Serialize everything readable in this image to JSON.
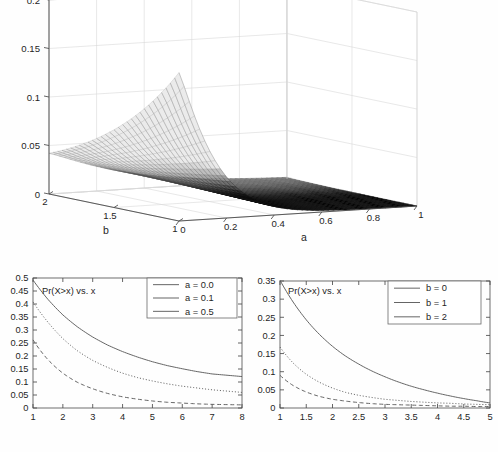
{
  "figure": {
    "background": "#ffffff",
    "line_color": "#5d5d5d",
    "axis_color": "#4a4a4a"
  },
  "chart_data": [
    {
      "id": "surface-3d",
      "type": "surface",
      "title": "",
      "xlabel": "a",
      "ylabel": "b",
      "zlabel": "",
      "xlim": [
        0,
        1
      ],
      "ylim": [
        1,
        2
      ],
      "zlim": [
        0,
        0.2
      ],
      "xticks": [
        "0",
        "0.2",
        "0.4",
        "0.6",
        "0.8",
        "1"
      ],
      "xtick_values": [
        0,
        0.2,
        0.4,
        0.6,
        0.8,
        1
      ],
      "yticks": [
        "2",
        "1.5",
        "1"
      ],
      "ytick_values": [
        2,
        1.5,
        1
      ],
      "zticks": [
        "0",
        "0.05",
        "0.1",
        "0.15",
        "0.2"
      ],
      "ztick_values": [
        0,
        0.05,
        0.1,
        0.15,
        0.2
      ],
      "grid": true,
      "legend": "none",
      "peak_value": 0.153,
      "peak_at": {
        "a": 0.0,
        "b": 1.0
      },
      "edge_value_b2_a0": 0.042,
      "description": "Mesh surface decaying from a peak near a=0,b=1 toward zero as a increases; dark shaded flat region at large a",
      "colormap": "gray"
    },
    {
      "id": "left-curves",
      "type": "line",
      "title": "Pr(X>x) vs. x",
      "xlabel": "",
      "ylabel": "",
      "xlim": [
        1,
        8
      ],
      "ylim": [
        0,
        0.5
      ],
      "xticks": [
        "1",
        "2",
        "3",
        "4",
        "5",
        "6",
        "7",
        "8"
      ],
      "xtick_values": [
        1,
        2,
        3,
        4,
        5,
        6,
        7,
        8
      ],
      "yticks": [
        "0",
        "0.05",
        "0.1",
        "0.15",
        "0.2",
        "0.25",
        "0.3",
        "0.35",
        "0.4",
        "0.45",
        "0.5"
      ],
      "ytick_values": [
        0,
        0.05,
        0.1,
        0.15,
        0.2,
        0.25,
        0.3,
        0.35,
        0.4,
        0.45,
        0.5
      ],
      "grid": false,
      "legend_position": "top-right",
      "x": [
        1,
        1.5,
        2,
        2.5,
        3,
        3.5,
        4,
        4.5,
        5,
        5.5,
        6,
        6.5,
        7,
        7.5,
        8
      ],
      "series": [
        {
          "name": "a = 0.0",
          "style": "solid",
          "values": [
            0.492,
            0.418,
            0.358,
            0.311,
            0.273,
            0.242,
            0.217,
            0.196,
            0.178,
            0.163,
            0.151,
            0.14,
            0.131,
            0.126,
            0.121
          ]
        },
        {
          "name": "a = 0.1",
          "style": "dotted",
          "values": [
            0.408,
            0.33,
            0.267,
            0.219,
            0.183,
            0.156,
            0.134,
            0.117,
            0.104,
            0.093,
            0.084,
            0.077,
            0.07,
            0.065,
            0.06
          ]
        },
        {
          "name": "a = 0.5",
          "style": "dashed",
          "values": [
            0.262,
            0.186,
            0.134,
            0.098,
            0.074,
            0.056,
            0.043,
            0.034,
            0.027,
            0.022,
            0.019,
            0.016,
            0.014,
            0.013,
            0.012
          ]
        }
      ]
    },
    {
      "id": "right-curves",
      "type": "line",
      "title": "Pr(X>x) vs. x",
      "xlabel": "",
      "ylabel": "",
      "xlim": [
        1,
        5
      ],
      "ylim": [
        0,
        0.35
      ],
      "xticks": [
        "1",
        "1.5",
        "2",
        "2.5",
        "3",
        "3.5",
        "4",
        "4.5",
        "5"
      ],
      "xtick_values": [
        1,
        1.5,
        2,
        2.5,
        3,
        3.5,
        4,
        4.5,
        5
      ],
      "yticks": [
        "0",
        "0.05",
        "0.1",
        "0.15",
        "0.2",
        "0.25",
        "0.3",
        "0.35"
      ],
      "ytick_values": [
        0,
        0.05,
        0.1,
        0.15,
        0.2,
        0.25,
        0.3,
        0.35
      ],
      "grid": false,
      "legend_position": "top-right",
      "x": [
        1,
        1.25,
        1.5,
        1.75,
        2,
        2.25,
        2.5,
        2.75,
        3,
        3.25,
        3.5,
        3.75,
        4,
        4.25,
        4.5,
        4.75,
        5
      ],
      "series": [
        {
          "name": "b = 0",
          "style": "solid",
          "values": [
            0.352,
            0.292,
            0.243,
            0.203,
            0.17,
            0.143,
            0.121,
            0.102,
            0.086,
            0.072,
            0.06,
            0.05,
            0.041,
            0.033,
            0.026,
            0.02,
            0.014
          ]
        },
        {
          "name": "b = 1",
          "style": "dotted",
          "values": [
            0.168,
            0.124,
            0.093,
            0.071,
            0.055,
            0.043,
            0.035,
            0.029,
            0.024,
            0.021,
            0.018,
            0.016,
            0.014,
            0.013,
            0.011,
            0.01,
            0.009
          ]
        },
        {
          "name": "b = 2",
          "style": "dashed",
          "values": [
            0.09,
            0.062,
            0.044,
            0.032,
            0.024,
            0.019,
            0.015,
            0.012,
            0.01,
            0.009,
            0.008,
            0.007,
            0.006,
            0.005,
            0.005,
            0.004,
            0.004
          ]
        }
      ]
    }
  ],
  "surface": {
    "axis_label_a": "a",
    "axis_label_b": "b",
    "z_ticks": [
      "0.2",
      "0.15",
      "0.1",
      "0.05",
      "0"
    ],
    "a_ticks": [
      "0",
      "0.2",
      "0.4",
      "0.6",
      "0.8",
      "1"
    ],
    "b_ticks": [
      "2",
      "1.5",
      "1"
    ]
  },
  "left_panel": {
    "annotation": "Pr(X>x) vs. x",
    "y_ticks": [
      "0.5",
      "0.45",
      "0.4",
      "0.35",
      "0.3",
      "0.25",
      "0.2",
      "0.15",
      "0.1",
      "0.05",
      "0"
    ],
    "x_ticks": [
      "1",
      "2",
      "3",
      "4",
      "5",
      "6",
      "7",
      "8"
    ],
    "legend": [
      {
        "label": "a = 0.0",
        "style": "solid"
      },
      {
        "label": "a = 0.1",
        "style": "dotted"
      },
      {
        "label": "a = 0.5",
        "style": "dashed"
      }
    ]
  },
  "right_panel": {
    "annotation": "Pr(X>x) vs. x",
    "y_ticks": [
      "0.35",
      "0.3",
      "0.25",
      "0.2",
      "0.15",
      "0.1",
      "0.05",
      "0"
    ],
    "x_ticks": [
      "1",
      "1.5",
      "2",
      "2.5",
      "3",
      "3.5",
      "4",
      "4.5",
      "5"
    ],
    "legend": [
      {
        "label": "b = 0",
        "style": "solid"
      },
      {
        "label": "b = 1",
        "style": "dotted"
      },
      {
        "label": "b = 2",
        "style": "dashed"
      }
    ]
  }
}
